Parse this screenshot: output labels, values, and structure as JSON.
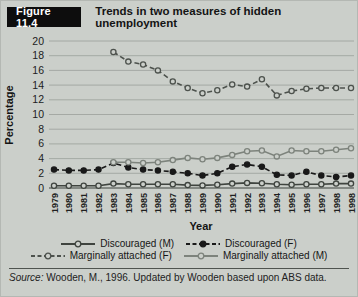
{
  "header": {
    "figure_label": "Figure 11.4",
    "title": "Trends in two measures of hidden unemployment"
  },
  "source": {
    "prefix": "Source:",
    "text": " Wooden, M., 1996. Updated by Wooden based upon ABS data."
  },
  "colors": {
    "background": "#cbcfca",
    "gridline": "#9aa09a",
    "axis": "#6d726d",
    "header_box": "#0d0d0d",
    "header_text": "#ffffff"
  },
  "chart_data": {
    "type": "line",
    "title": "Trends in two measures of hidden unemployment",
    "xlabel": "Year",
    "ylabel": "Percentage",
    "ylim": [
      0,
      20
    ],
    "ytick_step": 2,
    "grid": true,
    "legend_position": "bottom",
    "categories": [
      "1979",
      "1980",
      "1981",
      "1982",
      "1983",
      "1984",
      "1985",
      "1986",
      "1987",
      "1988",
      "1989",
      "1990",
      "1991",
      "1992",
      "1993",
      "1994",
      "1995",
      "1996",
      "1997",
      "1998",
      "1998"
    ],
    "series": [
      {
        "name": "Discouraged (M)",
        "style": "solid",
        "marker": "open",
        "color": "#3f443f",
        "values": [
          0.3,
          0.3,
          0.3,
          0.3,
          0.6,
          0.5,
          0.5,
          0.5,
          0.5,
          0.4,
          0.35,
          0.45,
          0.6,
          0.7,
          0.65,
          0.5,
          0.45,
          0.5,
          0.5,
          0.6,
          0.6
        ]
      },
      {
        "name": "Discouraged (F)",
        "style": "dashed",
        "marker": "filled",
        "color": "#191919",
        "values": [
          2.5,
          2.4,
          2.4,
          2.5,
          3.4,
          2.8,
          2.5,
          2.4,
          2.2,
          2.0,
          1.7,
          2.0,
          2.9,
          3.2,
          2.9,
          1.8,
          1.7,
          2.2,
          1.7,
          1.5,
          1.7
        ]
      },
      {
        "name": "Marginally attached (F)",
        "style": "dashed",
        "marker": "open",
        "color": "#4d524d",
        "values": [
          null,
          null,
          null,
          null,
          18.5,
          17.2,
          16.8,
          16.0,
          14.5,
          13.6,
          12.9,
          13.3,
          14.1,
          13.8,
          14.8,
          12.6,
          13.2,
          13.5,
          13.6,
          13.6,
          13.6
        ]
      },
      {
        "name": "Marginally attached (M)",
        "style": "solid",
        "marker": "open",
        "color": "#7d837c",
        "values": [
          null,
          null,
          null,
          null,
          3.5,
          3.5,
          3.4,
          3.5,
          3.8,
          4.1,
          3.9,
          4.1,
          4.5,
          5.0,
          5.1,
          4.3,
          5.1,
          5.0,
          5.0,
          5.2,
          5.4
        ]
      }
    ]
  }
}
